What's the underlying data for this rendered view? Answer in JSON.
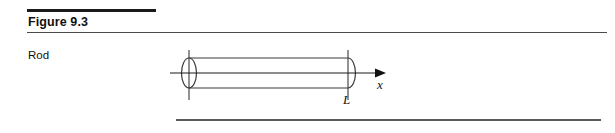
{
  "figure": {
    "title": "Figure 9.3",
    "caption_label": "Rod",
    "diagram": {
      "type": "cylindrical-rod-with-axis",
      "shape_name": "rod",
      "axis_label": "x",
      "length_label": "L",
      "arrow_direction": "right",
      "end_caps": [
        "left-ellipse",
        "right-arc"
      ],
      "tick_marks": [
        "left-end-vertical",
        "right-end-vertical"
      ]
    },
    "rules": {
      "top_rule": "thick",
      "title_rule": "thin",
      "bottom_rule": "medium"
    },
    "colors": {
      "ink": "#111111",
      "line": "#3a3a3a",
      "rule_thin": "#4a4a4a",
      "rule_bottom": "#5a5a5a",
      "background": "#ffffff"
    }
  }
}
